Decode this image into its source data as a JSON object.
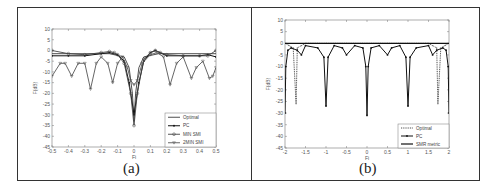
{
  "figure": {
    "panels": [
      {
        "id": "a",
        "caption": "(a)"
      },
      {
        "id": "b",
        "caption": "(b)"
      }
    ]
  },
  "chart_data": [
    {
      "type": "line",
      "panel": "(a)",
      "title": "",
      "xlabel": "Fi",
      "ylabel": "F(dB)",
      "xlim": [
        -0.5,
        0.5
      ],
      "ylim": [
        -45,
        10
      ],
      "xticks": [
        -0.5,
        -0.4,
        -0.3,
        -0.2,
        -0.1,
        0,
        0.1,
        0.2,
        0.3,
        0.4,
        0.5
      ],
      "yticks": [
        10,
        5,
        0,
        -5,
        -10,
        -15,
        -20,
        -25,
        -30,
        -35,
        -40,
        -45
      ],
      "grid": false,
      "legend_position": "lower right",
      "legend": [
        "Optimal",
        "PC",
        "MIN SMI",
        "2MIN SMI"
      ],
      "series": [
        {
          "name": "Optimal",
          "marker": "none",
          "x": [
            -0.5,
            -0.3,
            -0.15,
            -0.06,
            -0.03,
            -0.01,
            0,
            0.01,
            0.03,
            0.06,
            0.15,
            0.3,
            0.5
          ],
          "y": [
            -1.5,
            -1.5,
            -1.5,
            -3,
            -8,
            -20,
            -33,
            -20,
            -8,
            -3,
            -1.5,
            -1.5,
            -1.5
          ]
        },
        {
          "name": "PC",
          "marker": "dot",
          "x": [
            -0.5,
            -0.4,
            -0.3,
            -0.2,
            -0.15,
            -0.1,
            -0.06,
            -0.03,
            0,
            0.03,
            0.06,
            0.1,
            0.13,
            0.2,
            0.3,
            0.4,
            0.45,
            0.5
          ],
          "y": [
            -2.5,
            -2.5,
            -2.5,
            -1.5,
            -1,
            -2,
            -5,
            -15,
            -30,
            -15,
            -5,
            -1,
            0,
            -2.5,
            -2.5,
            -2.5,
            -2,
            -3
          ]
        },
        {
          "name": "MIN SMI",
          "marker": "circle",
          "x": [
            -0.5,
            -0.4,
            -0.3,
            -0.2,
            -0.15,
            -0.12,
            -0.1,
            -0.06,
            -0.02,
            0,
            0.02,
            0.06,
            0.1,
            0.13,
            0.16,
            0.2,
            0.3,
            0.4,
            0.45,
            0.5
          ],
          "y": [
            0,
            -1.5,
            -2,
            -1,
            -0.5,
            -1,
            -2,
            -6,
            -20,
            -35,
            -20,
            -4,
            -1,
            0,
            -1,
            -2,
            -2.5,
            -2.5,
            -2.5,
            0
          ]
        },
        {
          "name": "2MIN SMI",
          "marker": "triangle-down",
          "x": [
            -0.5,
            -0.45,
            -0.42,
            -0.38,
            -0.34,
            -0.3,
            -0.265,
            -0.23,
            -0.2,
            -0.16,
            -0.13,
            -0.1,
            -0.07,
            -0.04,
            -0.02,
            0,
            0.02,
            0.05,
            0.1,
            0.14,
            0.18,
            0.22,
            0.26,
            0.3,
            0.35,
            0.38,
            0.42,
            0.46,
            0.48,
            0.5
          ],
          "y": [
            -12,
            -6,
            -6,
            -12,
            -6,
            -6,
            -18,
            -6,
            -3,
            -6,
            -15,
            -6,
            -3,
            -8,
            -14,
            -16,
            -14,
            -6,
            -2,
            -1,
            -3,
            -16,
            -6,
            -3,
            -13,
            -8,
            -5,
            -13,
            -12,
            -8
          ]
        }
      ]
    },
    {
      "type": "line",
      "panel": "(b)",
      "title": "",
      "xlabel": "Fi",
      "ylabel": "F(dB)",
      "xlim": [
        -2,
        2
      ],
      "ylim": [
        -45,
        10
      ],
      "xticks": [
        -2,
        -1.5,
        -1,
        -0.5,
        0,
        0.5,
        1,
        1.5,
        2
      ],
      "yticks": [
        10,
        5,
        0,
        -5,
        -10,
        -15,
        -20,
        -25,
        -30,
        -35,
        -40,
        -45
      ],
      "grid": false,
      "legend_position": "lower right",
      "legend": [
        "Optimal",
        "PC",
        "SMR metric"
      ],
      "series": [
        {
          "name": "Optimal",
          "marker": "dot-light",
          "x": [
            -2,
            -1.9,
            -1.8,
            -1.73,
            -1.7,
            -1.6,
            -1.5,
            -1,
            -0.5,
            0,
            0.5,
            1,
            1.5,
            1.6,
            1.7,
            1.73,
            1.8,
            1.9,
            2
          ],
          "y": [
            0,
            -1,
            -2,
            -26,
            -2,
            -1,
            0,
            0,
            0,
            0,
            0,
            0,
            0,
            -1,
            -2,
            -26,
            -2,
            -1,
            0
          ]
        },
        {
          "name": "PC",
          "marker": "dot",
          "x": [
            -2,
            -1.98,
            -1.93,
            -1.85,
            -1.7,
            -1.6,
            -1.5,
            -1.2,
            -1.05,
            -1,
            -0.95,
            -0.8,
            -0.6,
            -0.5,
            -0.3,
            -0.1,
            -0.03,
            0,
            0.03,
            0.1,
            0.3,
            0.5,
            0.6,
            0.8,
            0.95,
            1,
            1.05,
            1.2,
            1.5,
            1.6,
            1.7,
            1.85,
            1.93,
            1.98,
            2
          ],
          "y": [
            -30,
            -10,
            -3,
            -2,
            -3,
            -5,
            -1,
            -2,
            -6,
            -27,
            -6,
            -1,
            -2,
            -5,
            -1,
            -2,
            -10,
            -31,
            -10,
            -2,
            -1,
            -5,
            -2,
            -1,
            -6,
            -27,
            -6,
            -2,
            -1,
            -5,
            -3,
            -2,
            -3,
            -10,
            -30
          ]
        },
        {
          "name": "SMR metric",
          "marker": "none",
          "x": [
            -2,
            -1.5,
            -1,
            -0.5,
            0,
            0.5,
            1,
            1.5,
            2
          ],
          "y": [
            0,
            0,
            0,
            0,
            0,
            0,
            0,
            0,
            0
          ]
        }
      ]
    }
  ]
}
